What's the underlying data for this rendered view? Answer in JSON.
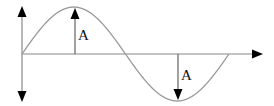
{
  "diagram": {
    "type": "sine-wave-amplitude",
    "colors": {
      "axis": "#888888",
      "wave": "#9a9a9a",
      "arrow": "#000000",
      "marker": "#555555",
      "background": "#ffffff"
    },
    "axes": {
      "origin": [
        22,
        54
      ],
      "x_end": 262,
      "y_top": 8,
      "y_bottom": 100
    },
    "wave": {
      "start_x": 22,
      "period_px": 207,
      "amplitude_px": 47,
      "baseline_y": 54
    },
    "labels": {
      "crest_amplitude": "A",
      "trough_amplitude": "A"
    },
    "markers": [
      {
        "name": "crest",
        "x": 75,
        "from_y": 54,
        "to_y": 8,
        "direction": "up"
      },
      {
        "name": "trough",
        "x": 178,
        "from_y": 54,
        "to_y": 100,
        "direction": "down"
      }
    ]
  }
}
